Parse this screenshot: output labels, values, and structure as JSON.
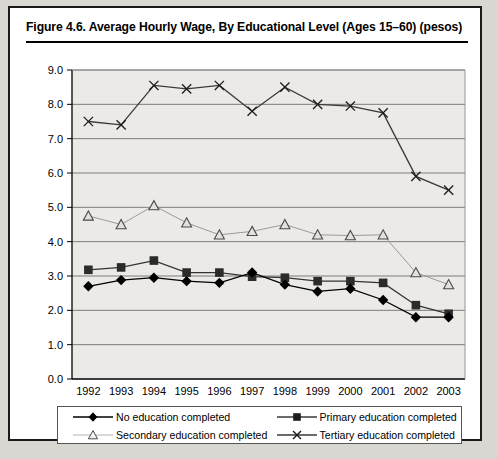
{
  "figure": {
    "title": "Figure 4.6.  Average Hourly Wage, By Educational Level (Ages 15–60) (pesos)"
  },
  "chart_data": {
    "type": "line",
    "title": "Figure 4.6.  Average Hourly Wage, By Educational Level (Ages 15–60) (pesos)",
    "xlabel": "",
    "ylabel": "",
    "x": [
      "1992",
      "1993",
      "1994",
      "1995",
      "1996",
      "1997",
      "1998",
      "1999",
      "2000",
      "2001",
      "2002",
      "2003"
    ],
    "categories": [
      "1992",
      "1993",
      "1994",
      "1995",
      "1996",
      "1997",
      "1998",
      "1999",
      "2000",
      "2001",
      "2002",
      "2003"
    ],
    "ylim": [
      0.0,
      9.0
    ],
    "ytick_labels": [
      "0.0",
      "1.0",
      "2.0",
      "3.0",
      "4.0",
      "5.0",
      "6.0",
      "7.0",
      "8.0",
      "9.0"
    ],
    "yticks": [
      0.0,
      1.0,
      2.0,
      3.0,
      4.0,
      5.0,
      6.0,
      7.0,
      8.0,
      9.0
    ],
    "grid": true,
    "legend_position": "bottom",
    "series": [
      {
        "name": "No education completed",
        "marker": "filled-diamond",
        "color": "#000000",
        "values": [
          2.7,
          2.88,
          2.95,
          2.85,
          2.8,
          3.1,
          2.75,
          2.55,
          2.63,
          2.3,
          1.8,
          1.8
        ]
      },
      {
        "name": "Primary education completed",
        "marker": "filled-square",
        "color": "#333333",
        "values": [
          3.18,
          3.25,
          3.45,
          3.1,
          3.1,
          2.98,
          2.95,
          2.85,
          2.85,
          2.8,
          2.15,
          1.9
        ]
      },
      {
        "name": "Secondary education completed",
        "marker": "open-triangle",
        "color": "#9a9a9a",
        "values": [
          4.75,
          4.5,
          5.05,
          4.55,
          4.2,
          4.3,
          4.5,
          4.2,
          4.18,
          4.2,
          3.1,
          2.75
        ]
      },
      {
        "name": "Tertiary education completed",
        "marker": "cross-x",
        "color": "#3a3a3a",
        "values": [
          7.5,
          7.4,
          8.55,
          8.45,
          8.55,
          7.8,
          8.5,
          8.0,
          7.95,
          7.75,
          5.9,
          5.5
        ]
      }
    ]
  },
  "legend": {
    "items": [
      {
        "label": "No education completed",
        "marker": "filled-diamond"
      },
      {
        "label": "Primary education completed",
        "marker": "filled-square"
      },
      {
        "label": "Secondary education completed",
        "marker": "open-triangle"
      },
      {
        "label": "Tertiary education completed",
        "marker": "cross-x"
      }
    ]
  },
  "colors": {
    "plot_background": "#eceae6",
    "grid": "#6f6f6f",
    "axis": "#000000",
    "card_border": "#1a1a1a",
    "page_background": "#d9d7d2"
  }
}
